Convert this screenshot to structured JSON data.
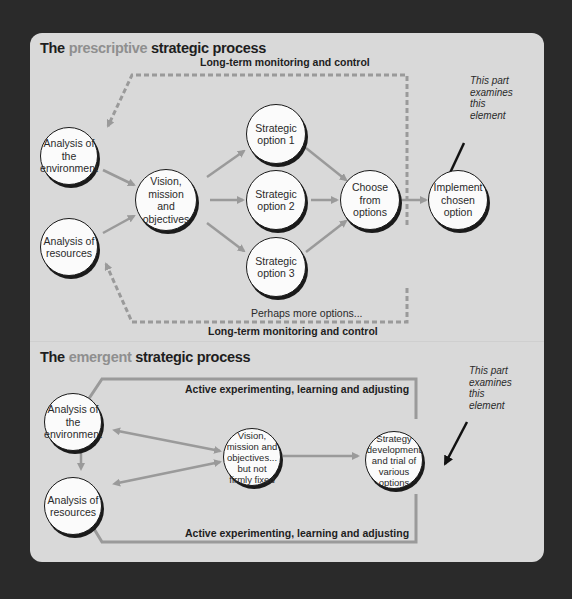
{
  "prescriptive": {
    "title_prefix": "The",
    "title_accent": "prescriptive",
    "title_suffix": "strategic process",
    "feedback_top": "Long-term monitoring and control",
    "feedback_bottom": "Long-term monitoring and control",
    "more_options": "Perhaps more options...",
    "note": "This part\nexamines\nthis\nelement",
    "nodes": {
      "env": "Analysis of the environment",
      "res": "Analysis of resources",
      "vision": "Vision, mission and objectives",
      "opt1": "Strategic option 1",
      "opt2": "Strategic option 2",
      "opt3": "Strategic option 3",
      "choose": "Choose from options",
      "implement": "Implement chosen option"
    }
  },
  "emergent": {
    "title_prefix": "The",
    "title_accent": "emergent",
    "title_suffix": "strategic process",
    "feedback_top": "Active experimenting, learning and adjusting",
    "feedback_bottom": "Active experimenting, learning and adjusting",
    "note": "This part\nexamines\nthis\nelement",
    "nodes": {
      "env": "Analysis of the environment",
      "res": "Analysis of resources",
      "vision": "Vision, mission and objectives... but not firmly fixed",
      "strategy": "Strategy development and trial of various options"
    }
  },
  "colors": {
    "background": "#2a2a2a",
    "panel": "#d9d9d9",
    "arrow": "#9a9a9a",
    "accent_text": "#8f8f8f",
    "node_fill": "#fbfbfb"
  }
}
